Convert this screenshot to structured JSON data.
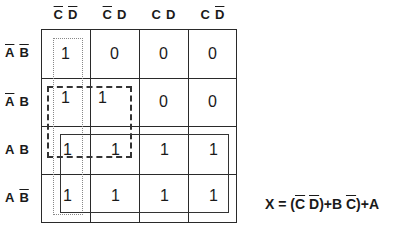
{
  "kmap": {
    "columns": [
      {
        "parts": [
          {
            "t": "C",
            "bar": true
          },
          {
            "t": "D",
            "bar": true
          }
        ]
      },
      {
        "parts": [
          {
            "t": "C",
            "bar": true
          },
          {
            "t": "D",
            "bar": false
          }
        ]
      },
      {
        "parts": [
          {
            "t": "C",
            "bar": false
          },
          {
            "t": "D",
            "bar": false
          }
        ]
      },
      {
        "parts": [
          {
            "t": "C",
            "bar": false
          },
          {
            "t": "D",
            "bar": true
          }
        ]
      }
    ],
    "rows": [
      {
        "parts": [
          {
            "t": "A",
            "bar": true
          },
          {
            "t": "B",
            "bar": true
          }
        ]
      },
      {
        "parts": [
          {
            "t": "A",
            "bar": true
          },
          {
            "t": "B",
            "bar": false
          }
        ]
      },
      {
        "parts": [
          {
            "t": "A",
            "bar": false
          },
          {
            "t": "B",
            "bar": false
          }
        ]
      },
      {
        "parts": [
          {
            "t": "A",
            "bar": false
          },
          {
            "t": "B",
            "bar": true
          }
        ]
      }
    ],
    "column_labels": [
      "C̄ D̄",
      "C̄ D",
      "C D",
      "C D̄"
    ],
    "row_labels": [
      "Ā B̄",
      "Ā B",
      "A B",
      "A B̄"
    ],
    "values": [
      [
        "1",
        "0",
        "0",
        "0"
      ],
      [
        "1",
        "1",
        "0",
        "0"
      ],
      [
        "1",
        "1",
        "1",
        "1"
      ],
      [
        "1",
        "1",
        "1",
        "1"
      ]
    ],
    "groups": [
      {
        "name": "C-bar D-bar column",
        "style": "dotted",
        "cells": "column 1, all rows"
      },
      {
        "name": "A-bar B C-bar / A B C-bar",
        "style": "dashed",
        "cells": "rows 2-3, columns 1-2"
      },
      {
        "name": "A",
        "style": "solid",
        "cells": "rows 3-4, all columns"
      }
    ]
  },
  "equation": {
    "lhs": "X",
    "eq": " = ",
    "parts": [
      {
        "t": "(",
        "bar": false
      },
      {
        "t": "C",
        "bar": true
      },
      {
        "t": " ",
        "bar": false
      },
      {
        "t": "D",
        "bar": true
      },
      {
        "t": ")+B ",
        "bar": false
      },
      {
        "t": "C",
        "bar": true
      },
      {
        "t": ")+A",
        "bar": false
      }
    ],
    "text": "X = (C̄ D̄)+B C̄)+A"
  }
}
